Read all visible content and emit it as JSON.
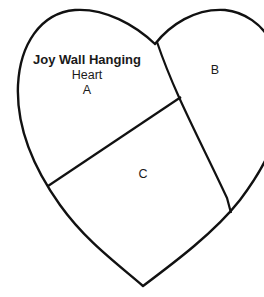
{
  "diagram": {
    "title": "Joy Wall Hanging",
    "subtitle": "Heart",
    "pieces": [
      {
        "label": "A"
      },
      {
        "label": "B"
      },
      {
        "label": "C"
      }
    ],
    "stroke_color": "#111111",
    "background_color": "#ffffff"
  }
}
